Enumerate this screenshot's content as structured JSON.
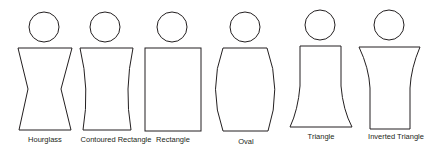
{
  "diagram": {
    "figures": [
      {
        "label": "Hourglass"
      },
      {
        "label": "Contoured Rectangle"
      },
      {
        "label": "Rectangle"
      },
      {
        "label": "Oval"
      },
      {
        "label": "Triangle"
      },
      {
        "label": "Inverted Triangle"
      }
    ],
    "stroke_color": "#231f20",
    "background": "#ffffff"
  }
}
